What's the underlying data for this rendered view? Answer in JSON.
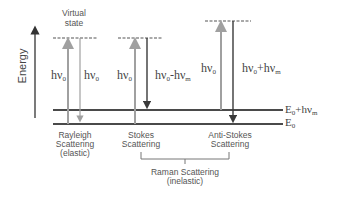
{
  "diagram": {
    "axis_label": "Energy",
    "virtual_state_label_line1": "Virtual",
    "virtual_state_label_line2": "state",
    "levels": {
      "excited": {
        "label_main": "E",
        "label_sub": "0",
        "label_plus": "+hν",
        "label_plus_sub": "m"
      },
      "ground": {
        "label_main": "E",
        "label_sub": "0"
      }
    },
    "processes": [
      {
        "name": "Rayleigh",
        "label_line1": "Rayleigh",
        "label_line2": "Scattering",
        "label_line3": "(elastic)",
        "incident": {
          "text": "hν",
          "sub": "0"
        },
        "emitted": {
          "text": "hν",
          "sub": "0"
        }
      },
      {
        "name": "Stokes",
        "label_line1": "Stokes",
        "label_line2": "Scattering",
        "incident": {
          "text": "hν",
          "sub": "0"
        },
        "emitted": {
          "text": "hν",
          "sub": "0",
          "mid": "-hν",
          "sub2": "m"
        }
      },
      {
        "name": "Anti-Stokes",
        "label_line1": "Anti-Stokes",
        "label_line2": "Scattering",
        "incident": {
          "text": "hν",
          "sub": "0"
        },
        "emitted": {
          "text": "hν",
          "sub": "0",
          "mid": "+hν",
          "sub2": "m"
        }
      }
    ],
    "group_label_line1": "Raman Scattering",
    "group_label_line2": "(inelastic)",
    "colors": {
      "incident_arrow": "#a0a0a0",
      "emitted_arrow": "#3a3a3a",
      "level_line": "#4a4a4a",
      "text": "#444444",
      "bracket": "#777777"
    }
  }
}
